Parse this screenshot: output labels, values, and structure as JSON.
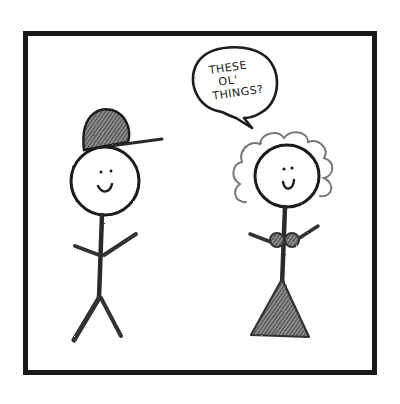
{
  "comic": {
    "panel_count": 1,
    "colors": {
      "ink": "#1a1a1a",
      "pencil_shade": "#555555",
      "background": "#ffffff"
    },
    "characters": [
      {
        "id": "boy",
        "description": "stick figure wearing a shaded baseball cap, smiling"
      },
      {
        "id": "girl",
        "description": "stick figure with curly hair, smiling, wearing a bra-like top and triangle skirt"
      }
    ],
    "speech_bubble": {
      "speaker": "girl",
      "lines": [
        "THESE",
        "OL'",
        "THINGS?"
      ]
    }
  }
}
